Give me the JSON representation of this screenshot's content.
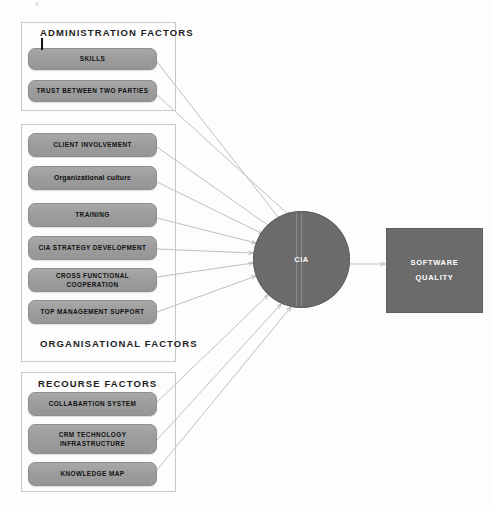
{
  "diagram": {
    "title_artifact": "",
    "groups": [
      {
        "id": "administration",
        "title": "ADMINISTRATION  FACTORS",
        "frame": {
          "x": 21,
          "y": 22,
          "w": 155,
          "h": 89
        },
        "title_pos": {
          "x": 40,
          "y": 27
        },
        "items": [
          {
            "label": "SKILLS",
            "x": 28,
            "y": 48,
            "w": 129,
            "h": 22,
            "style": "caps"
          },
          {
            "label": "TRUST BETWEEN TWO PARTIES",
            "x": 28,
            "y": 80,
            "w": 129,
            "h": 22,
            "style": "caps"
          }
        ]
      },
      {
        "id": "organisational",
        "title": "ORGANISATIONAL  FACTORS",
        "frame": {
          "x": 21,
          "y": 124,
          "w": 155,
          "h": 238
        },
        "title_pos": {
          "x": 40,
          "y": 338
        },
        "items": [
          {
            "label": "CLIENT INVOLVEMENT",
            "x": 28,
            "y": 133,
            "w": 129,
            "h": 24,
            "style": "caps"
          },
          {
            "label": "Organizational culture",
            "x": 28,
            "y": 166,
            "w": 129,
            "h": 24,
            "style": "mixed"
          },
          {
            "label": "TRAINING",
            "x": 28,
            "y": 203,
            "w": 129,
            "h": 24,
            "style": "caps"
          },
          {
            "label": "CIA STRATEGY DEVELOPMENT",
            "x": 28,
            "y": 236,
            "w": 129,
            "h": 24,
            "style": "caps"
          },
          {
            "label": "CROSS FUNCTIONAL COOPERATION",
            "x": 28,
            "y": 268,
            "w": 129,
            "h": 24,
            "style": "caps"
          },
          {
            "label": "TOP MANAGEMENT SUPPORT",
            "x": 28,
            "y": 300,
            "w": 129,
            "h": 24,
            "style": "caps"
          }
        ]
      },
      {
        "id": "recourse",
        "title": "RECOURSE FACTORS",
        "frame": {
          "x": 21,
          "y": 372,
          "w": 155,
          "h": 120
        },
        "title_pos": {
          "x": 38,
          "y": 378
        },
        "items": [
          {
            "label": "COLLABARTION SYSTEM",
            "x": 28,
            "y": 392,
            "w": 129,
            "h": 24,
            "style": "caps"
          },
          {
            "label": "CRM TECHNOLOGY\nINFRASTRUCTURE",
            "x": 28,
            "y": 424,
            "w": 129,
            "h": 30,
            "style": "caps"
          },
          {
            "label": "KNOWLEDGE MAP",
            "x": 28,
            "y": 462,
            "w": 129,
            "h": 24,
            "style": "caps"
          }
        ]
      }
    ],
    "hub": {
      "label": "CIA",
      "shape": "circle",
      "cx": 301.5,
      "cy": 259.5,
      "r": 48.5,
      "fill": "#6b6b6b",
      "text_color": "#ffffff"
    },
    "outcome": {
      "line1": "SOFTWARE",
      "line2": "QUALITY",
      "shape": "rectangle",
      "x": 386,
      "y": 228,
      "w": 95,
      "h": 83,
      "fill": "#6b6b6b",
      "text_color": "#ffffff"
    },
    "colors": {
      "factor_fill": "#9d9d9d",
      "factor_border": "#8e8e8e",
      "frame_border": "#c9c9c9",
      "hub_fill": "#6b6b6b",
      "outcome_fill": "#6b6b6b",
      "arrow_stroke": "#b0b0b0",
      "background": "#fdfdfd",
      "text_dark": "#111111",
      "text_light": "#ffffff"
    },
    "connections": [
      {
        "from": "SKILLS",
        "to": "CIA",
        "x1": 157,
        "y1": 62,
        "x2": 282,
        "y2": 222
      },
      {
        "from": "TRUST BETWEEN TWO PARTIES",
        "to": "CIA",
        "x1": 157,
        "y1": 95,
        "x2": 290,
        "y2": 216
      },
      {
        "from": "CLIENT INVOLVEMENT",
        "to": "CIA",
        "x1": 157,
        "y1": 147,
        "x2": 272,
        "y2": 228
      },
      {
        "from": "Organizational culture",
        "to": "CIA",
        "x1": 157,
        "y1": 182,
        "x2": 263,
        "y2": 234
      },
      {
        "from": "TRAINING",
        "to": "CIA",
        "x1": 157,
        "y1": 218,
        "x2": 256,
        "y2": 243
      },
      {
        "from": "CIA STRATEGY DEVELOPMENT",
        "to": "CIA",
        "x1": 157,
        "y1": 249,
        "x2": 253,
        "y2": 253
      },
      {
        "from": "CROSS FUNCTIONAL COOPERATION",
        "to": "CIA",
        "x1": 157,
        "y1": 277,
        "x2": 253,
        "y2": 263
      },
      {
        "from": "TOP MANAGEMENT SUPPORT",
        "to": "CIA",
        "x1": 157,
        "y1": 312,
        "x2": 256,
        "y2": 276
      },
      {
        "from": "COLLABARTION SYSTEM",
        "to": "CIA",
        "x1": 157,
        "y1": 402,
        "x2": 268,
        "y2": 295
      },
      {
        "from": "CRM TECHNOLOGY INFRASTRUCTURE",
        "to": "CIA",
        "x1": 157,
        "y1": 440,
        "x2": 281,
        "y2": 304
      },
      {
        "from": "KNOWLEDGE MAP",
        "to": "CIA",
        "x1": 157,
        "y1": 470,
        "x2": 291,
        "y2": 307
      },
      {
        "from": "CIA",
        "to": "SOFTWARE QUALITY",
        "x1": 350,
        "y1": 264,
        "x2": 385,
        "y2": 264
      }
    ]
  }
}
